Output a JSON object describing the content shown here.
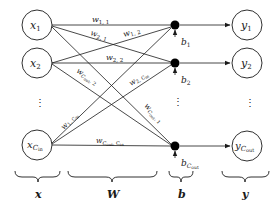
{
  "diagram": {
    "type": "fully-connected-layer",
    "inputs": [
      {
        "base": "x",
        "sub": "1"
      },
      {
        "base": "x",
        "sub": "2"
      },
      {
        "base": "x",
        "sub": "C",
        "subsub": "in"
      }
    ],
    "biases": [
      {
        "base": "b",
        "sub": "1"
      },
      {
        "base": "b",
        "sub": "2"
      },
      {
        "base": "b",
        "sub": "C",
        "subsub": "out"
      }
    ],
    "outputs": [
      {
        "base": "y",
        "sub": "1"
      },
      {
        "base": "y",
        "sub": "2"
      },
      {
        "base": "y",
        "sub": "C",
        "subsub": "out"
      }
    ],
    "weights": [
      {
        "base": "w",
        "sub": "1, 1"
      },
      {
        "base": "w",
        "sub": "2, 1"
      },
      {
        "base": "w",
        "sub": "1, 2"
      },
      {
        "base": "w",
        "sub": "2, 2"
      },
      {
        "base": "w",
        "sub": "C",
        "subsub": "out",
        "tail": ", 2"
      },
      {
        "base": "w",
        "sub": "2, C",
        "subsub2": "in"
      },
      {
        "base": "w",
        "sub": "1, C",
        "subsub2": "in"
      },
      {
        "base": "w",
        "sub": "C",
        "subsub": "out",
        "tail": ", 1"
      },
      {
        "base": "w",
        "sub": "C",
        "subsub": "out",
        "tail": ", C",
        "subsub2": "in"
      }
    ],
    "ellipsis": "⋮",
    "group_labels": {
      "inputs": "x",
      "weights": "W",
      "biases": "b",
      "outputs": "y"
    },
    "colors": {
      "stroke": "#1a1a1a",
      "node_fill": "#ffffff",
      "bias_fill": "#000000",
      "background": "#ffffff"
    }
  }
}
